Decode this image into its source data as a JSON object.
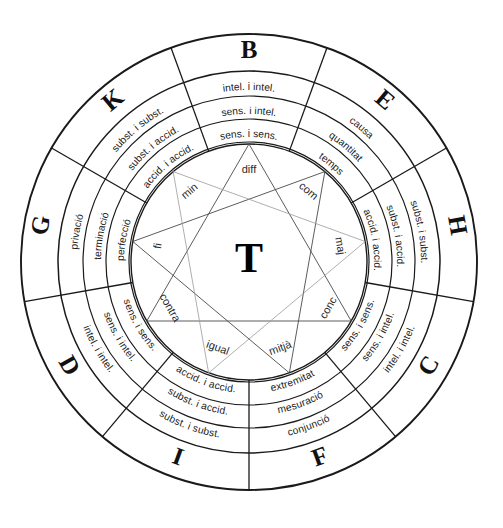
{
  "figure": {
    "center_label": "T",
    "geometry": {
      "cx": 249,
      "cy": 262,
      "r_outer": 228,
      "r_letter_in": 191,
      "r_ring1_in": 166,
      "r_ring2_in": 143,
      "r_ring3_in": 120,
      "r_inner_circle": 118,
      "sector_count": 9,
      "sector_span_deg": 40
    },
    "colors": {
      "stroke": "#1a1a1a",
      "star_stroke": "#4a4a4a",
      "star_faint": "#9a9a9a",
      "background": "#ffffff",
      "text": "#1a1a1a"
    },
    "sectors": [
      {
        "letter": "B",
        "center_deg": 0,
        "rings": [
          "intel. i intel.",
          "sens. i intel.",
          "sens. i sens."
        ]
      },
      {
        "letter": "E",
        "center_deg": 40,
        "rings": [
          "causa",
          "quantitat",
          "temps"
        ]
      },
      {
        "letter": "H",
        "center_deg": 80,
        "rings": [
          "subst. i subst.",
          "subst. i accid.",
          "accid. i accid."
        ]
      },
      {
        "letter": "C",
        "center_deg": 120,
        "rings": [
          "intel. i intel.",
          "sens. i intel.",
          "sens. i sens."
        ]
      },
      {
        "letter": "F",
        "center_deg": 160,
        "rings": [
          "conjunció",
          "mesuració",
          "extremitat"
        ]
      },
      {
        "letter": "I",
        "center_deg": 200,
        "rings": [
          "subst. i subst.",
          "subst. i accid.",
          "accid. i accid."
        ]
      },
      {
        "letter": "D",
        "center_deg": 240,
        "rings": [
          "intel. i intel.",
          "sens. i intel.",
          "sens. i sens."
        ]
      },
      {
        "letter": "G",
        "center_deg": 280,
        "rings": [
          "privació",
          "terminació",
          "perfecció"
        ]
      },
      {
        "letter": "K",
        "center_deg": 320,
        "rings": [
          "subst. i subst.",
          "subst. i accid.",
          "accid. i accid."
        ]
      }
    ],
    "inner_labels": [
      {
        "text": "diff",
        "angle_deg": 0,
        "radius": 92
      },
      {
        "text": "com",
        "angle_deg": 40,
        "radius": 92
      },
      {
        "text": "maj",
        "angle_deg": 80,
        "radius": 92
      },
      {
        "text": "conc",
        "angle_deg": 120,
        "radius": 92
      },
      {
        "text": "mitjà",
        "angle_deg": 160,
        "radius": 92
      },
      {
        "text": "igual",
        "angle_deg": 200,
        "radius": 92
      },
      {
        "text": "contra",
        "angle_deg": 240,
        "radius": 92
      },
      {
        "text": "fi",
        "angle_deg": 280,
        "radius": 92
      },
      {
        "text": "min",
        "angle_deg": 320,
        "radius": 92
      }
    ],
    "star_triangles": [
      {
        "name": "triangle-bcd",
        "vertices_deg": [
          0,
          120,
          240
        ],
        "style": "solid"
      },
      {
        "name": "triangle-efg",
        "vertices_deg": [
          40,
          160,
          280
        ],
        "style": "solid"
      },
      {
        "name": "triangle-hik",
        "vertices_deg": [
          80,
          200,
          320
        ],
        "style": "faint"
      }
    ]
  },
  "chart_data": {
    "type": "pie",
    "categories": [
      "B",
      "E",
      "H",
      "C",
      "F",
      "I",
      "D",
      "G",
      "K"
    ],
    "values": [
      40,
      40,
      40,
      40,
      40,
      40,
      40,
      40,
      40
    ],
    "xlabel": "",
    "ylabel": "",
    "legend_position": "none",
    "grid": false
  }
}
